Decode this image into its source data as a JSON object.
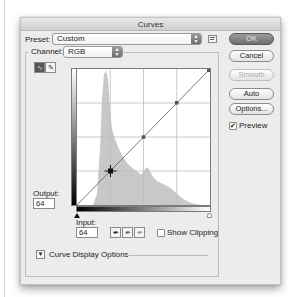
{
  "window": {
    "title": "Curves"
  },
  "preset": {
    "label": "Preset:",
    "value": "Custom",
    "menu_icon": "preset-options-icon"
  },
  "channel": {
    "label": "Channel:",
    "value": "RGB"
  },
  "tools": {
    "curve_tool": "curve-point-icon",
    "pencil_tool": "pencil-icon"
  },
  "buttons": {
    "ok": "OK",
    "cancel": "Cancel",
    "smooth": "Smooth",
    "auto": "Auto",
    "options": "Options..."
  },
  "preview": {
    "label": "Preview",
    "checked": true
  },
  "output": {
    "label": "Output:",
    "value": "64"
  },
  "input": {
    "label": "Input:",
    "value": "64"
  },
  "eyedroppers": [
    "black-point-eyedropper-icon",
    "gray-point-eyedropper-icon",
    "white-point-eyedropper-icon"
  ],
  "show_clipping": {
    "label": "Show Clipping",
    "checked": false
  },
  "display_options": {
    "label": "Curve Display Options",
    "expanded": false
  },
  "curve": {
    "points": [
      [
        0,
        0
      ],
      [
        64,
        64
      ],
      [
        128,
        128
      ],
      [
        192,
        192
      ],
      [
        255,
        255
      ]
    ],
    "selected_point": [
      64,
      64
    ],
    "grid_divisions": 4
  },
  "histogram": {
    "channel": "RGB",
    "shape": [
      0,
      0,
      0,
      0,
      0,
      0,
      0,
      0,
      0,
      0,
      0,
      0,
      2,
      8,
      30,
      60,
      90,
      100,
      96,
      85,
      72,
      62,
      56,
      52,
      48,
      44,
      40,
      38,
      36,
      33,
      31,
      30,
      33,
      31,
      29,
      26,
      22,
      20,
      19,
      18,
      17,
      16,
      14,
      12,
      10,
      8,
      6,
      4,
      3,
      2,
      2,
      1,
      1,
      0,
      0,
      0
    ]
  }
}
